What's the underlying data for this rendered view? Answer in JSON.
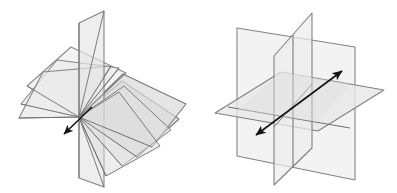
{
  "document": {
    "kind": "geometry-illustration",
    "background_color": "#ffffff",
    "width": 397,
    "height": 193,
    "figure_count": 2,
    "description": "Two line-drawing diagrams of planes in three-dimensional space, drawn in light gray translucent fill with darker gray outlines and black double-headed / single-headed arrows marking a line."
  },
  "style": {
    "plane_fill": "#f0f0f0",
    "plane_fill_shaded": "#e3e3e3",
    "plane_fill_dark": "#d6d6d6",
    "plane_stroke": "#7c7c7c",
    "plane_stroke_light": "#9b9b9b",
    "arrow_color": "#1a1a1a",
    "plane_opacity": 0.55,
    "stroke_width": 1.1
  },
  "figures": [
    {
      "id": "left-figure",
      "name": "pencil-of-planes-through-a-line",
      "label": "",
      "center_x": 100,
      "center_y": 96,
      "axis": {
        "name": "common-line-of-intersection",
        "pivot_point": [
          79,
          117
        ],
        "arrow_tip": [
          62,
          136
        ],
        "arrow_heads": 1,
        "direction": "down-left"
      },
      "plane_count": 6,
      "planes": [
        {
          "id": "lf-plane-1",
          "name": "plane-fan-1",
          "points": "79,117 27,86 71,47 126,73",
          "fill": "#efefef",
          "stroke": "#8a8a8a"
        },
        {
          "id": "lf-plane-2",
          "name": "plane-fan-2",
          "points": "79,117 21,104 57,60 119,68",
          "fill": "#ececec",
          "stroke": "#878787"
        },
        {
          "id": "lf-plane-3",
          "name": "plane-fan-3",
          "points": "79,117 19,118 43,72 111,66",
          "fill": "#e9e9e9",
          "stroke": "#848484"
        },
        {
          "id": "lf-plane-4",
          "name": "plane-fan-4-vertical",
          "points": "79,117 79,178 104,187 104,11 79,23",
          "fill": "#e5e5e5",
          "stroke": "#7f7f7f"
        },
        {
          "id": "lf-plane-5",
          "name": "plane-fan-5",
          "points": "79,117 137,157 179,119 122,81",
          "fill": "#dfdfdf",
          "stroke": "#7b7b7b"
        },
        {
          "id": "lf-plane-6",
          "name": "plane-fan-6",
          "points": "79,117 152,147 186,104 123,74",
          "fill": "#dadada",
          "stroke": "#777777"
        }
      ]
    },
    {
      "id": "right-figure",
      "name": "three-mutually-intersecting-planes",
      "label": "",
      "center_x": 298,
      "center_y": 96,
      "axis": {
        "name": "oblique-line-through-planes",
        "arrow_start": [
          253,
          138
        ],
        "arrow_end": [
          345,
          69
        ],
        "arrow_heads": 2,
        "direction": "double-headed diagonal"
      },
      "plane_count": 3,
      "planes": [
        {
          "id": "rf-plane-horizontal",
          "name": "horizontal-plane",
          "points": "215,113 281,72 384,90 318,131",
          "fill": "#ececec",
          "stroke": "#808080"
        },
        {
          "id": "rf-plane-vertical-left",
          "name": "vertical-plane-left",
          "points": "237,28 237,156 355,180 355,47",
          "fill": "#efefef",
          "stroke": "#828282"
        },
        {
          "id": "rf-plane-vertical-right",
          "name": "vertical-plane-right",
          "points": "274,185 274,56 312,13 312,148",
          "fill": "#ededed",
          "stroke": "#7e7e7e"
        }
      ]
    }
  ]
}
